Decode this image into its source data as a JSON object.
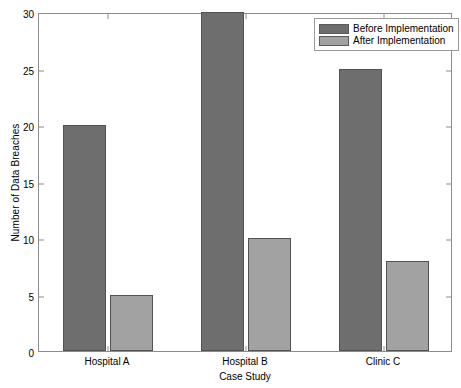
{
  "chart_data": {
    "type": "bar",
    "title": "",
    "subtitle": "",
    "xlabel": "Case Study",
    "ylabel": "Number of Data Breaches",
    "categories": [
      "Hospital A",
      "Hospital B",
      "Clinic C"
    ],
    "series": [
      {
        "name": "Before Implementation",
        "values": [
          20,
          30,
          25
        ],
        "color": "#6e6e6e"
      },
      {
        "name": "After Implementation",
        "values": [
          5,
          10,
          8
        ],
        "color": "#a2a2a2"
      }
    ],
    "ylim": [
      0,
      30
    ],
    "yticks": [
      0,
      5,
      10,
      15,
      20,
      25,
      30
    ],
    "ytick_labels": [
      "0",
      "5",
      "10",
      "15",
      "20",
      "25",
      "30"
    ],
    "xlim": [
      0.5,
      3.5
    ],
    "grid": false,
    "legend_position": "top-right",
    "legend_entries": [
      "Before Implementation",
      "After Implementation"
    ],
    "axis_color": "#8c8c8c",
    "background": "#ffffff"
  }
}
